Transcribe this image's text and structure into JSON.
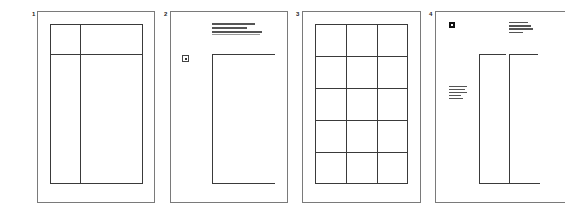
{
  "panels": [
    {
      "number": "1",
      "layout": "two-column grid with header row"
    },
    {
      "number": "2",
      "layout": "single text column with marginal icon"
    },
    {
      "number": "3",
      "layout": "3 x 5 modular grid"
    },
    {
      "number": "4",
      "layout": "two narrow columns with marginal notes"
    }
  ],
  "colors": {
    "frame": "#7a7a7a",
    "line": "#3a3a3a",
    "text_bar": "#555555"
  }
}
